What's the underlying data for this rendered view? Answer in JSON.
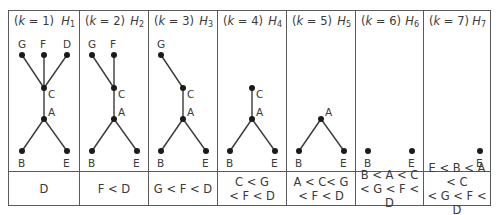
{
  "diagram": {
    "columns": [
      {
        "k": "1",
        "h": "1",
        "order_line1": "D",
        "order_line2": "",
        "nodes": [
          "G",
          "F",
          "D",
          "C",
          "A",
          "B",
          "E"
        ]
      },
      {
        "k": "2",
        "h": "2",
        "order_line1": "F < D",
        "order_line2": "",
        "nodes": [
          "G",
          "F",
          "C",
          "A",
          "B",
          "E"
        ]
      },
      {
        "k": "3",
        "h": "3",
        "order_line1": "G < F < D",
        "order_line2": "",
        "nodes": [
          "G",
          "C",
          "A",
          "B",
          "E"
        ]
      },
      {
        "k": "4",
        "h": "4",
        "order_line1": "C < G",
        "order_line2": "< F < D",
        "nodes": [
          "C",
          "A",
          "B",
          "E"
        ]
      },
      {
        "k": "5",
        "h": "5",
        "order_line1": "A < C< G",
        "order_line2": "< F < D",
        "nodes": [
          "A",
          "B",
          "E"
        ]
      },
      {
        "k": "6",
        "h": "6",
        "order_line1": "B < A < C",
        "order_line2": "< G < F < D",
        "nodes": [
          "B",
          "E"
        ]
      },
      {
        "k": "7",
        "h": "7",
        "order_line1": "E < B < A < C",
        "order_line2": "< G < F < D",
        "nodes": [
          "E"
        ]
      }
    ],
    "header_k_label": "k",
    "header_h_label": "H",
    "labels": {
      "G": "G",
      "F": "F",
      "D": "D",
      "C": "C",
      "A": "A",
      "B": "B",
      "E": "E"
    },
    "line_color": "#3a3a3a",
    "border_color": "#5a5a5a"
  }
}
